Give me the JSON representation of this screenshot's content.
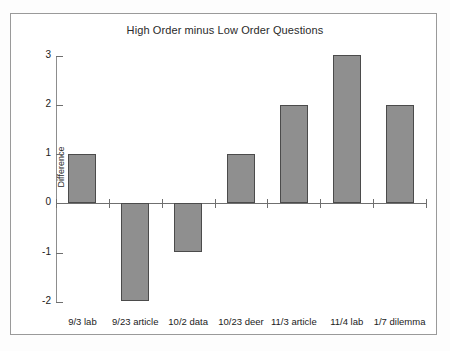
{
  "chart_data": {
    "type": "bar",
    "title": "High Order minus Low Order Questions",
    "xlabel": "",
    "ylabel": "Difference",
    "categories": [
      "9/3 lab",
      "9/23 article",
      "10/2 data",
      "10/23 deer",
      "11/3 article",
      "11/4 lab",
      "1/7 dilemma"
    ],
    "values": [
      1,
      -2,
      -1,
      1,
      2,
      3,
      2
    ],
    "ylim": [
      -2,
      3
    ],
    "ytick_labels": [
      "3",
      "2",
      "1",
      "0",
      "-1",
      "-2"
    ],
    "ytick_values": [
      3,
      2,
      1,
      0,
      -1,
      -2
    ],
    "grid": false,
    "legend": false,
    "bar_color": "#8f8f8f",
    "bar_border_color": "#4b4b4b",
    "axis_color": "#6f6f6f",
    "background": "#ffffff"
  }
}
